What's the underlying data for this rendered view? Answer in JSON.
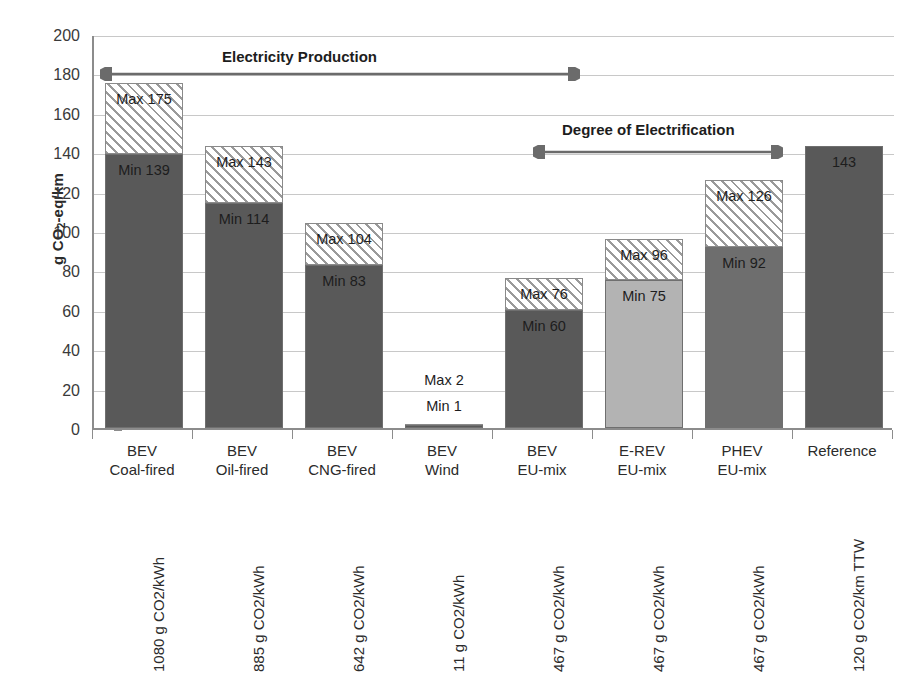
{
  "chart_data": {
    "type": "bar",
    "title": "",
    "xlabel": "",
    "ylabel": "g CO2-eq/km",
    "ylabel_parts": {
      "pre": "g CO",
      "sub": "2",
      "post": "-eq/km"
    },
    "ylim": [
      0,
      200
    ],
    "ytick_step": 20,
    "yticks": [
      0,
      20,
      40,
      60,
      80,
      100,
      120,
      140,
      160,
      180,
      200
    ],
    "grid": true,
    "legend": "none",
    "stacked": "min-max range",
    "categories": [
      "BEV Coal-fired",
      "BEV Oil-fired",
      "BEV CNG-fired",
      "BEV Wind",
      "BEV EU-mix",
      "E-REV EU-mix",
      "PHEV EU-mix",
      "Reference"
    ],
    "series": [
      {
        "name": "Min",
        "values": [
          139,
          114,
          83,
          1,
          60,
          75,
          92,
          143
        ]
      },
      {
        "name": "Max",
        "values": [
          175,
          143,
          104,
          2,
          76,
          96,
          126,
          143
        ]
      }
    ],
    "annotations": [
      {
        "text": "Electricity Production",
        "span": [
          "BEV Coal-fired",
          "BEV EU-mix"
        ],
        "y": 180
      },
      {
        "text": "Degree of Electrification",
        "span": [
          "BEV EU-mix",
          "PHEV EU-mix"
        ],
        "y": 143
      }
    ]
  },
  "y_axis": {
    "title_pre": "g CO",
    "title_sub": "2",
    "title_post": "-eq/km",
    "ticks": [
      "200",
      "180",
      "160",
      "140",
      "120",
      "100",
      "80",
      "60",
      "40",
      "20",
      "0"
    ]
  },
  "annotations": {
    "electricity_production": "Electricity Production",
    "degree_of_electrification": "Degree of Electrification"
  },
  "bars": [
    {
      "key": "bev-coal-fired",
      "cat_line1": "BEV",
      "cat_line2": "Coal-fired",
      "sub_label": "1080 g CO2/kWh",
      "min": 139,
      "max": 175,
      "min_label": "Min 139",
      "max_label": "Max 175",
      "fill": "dark",
      "label_placement": "inside"
    },
    {
      "key": "bev-oil-fired",
      "cat_line1": "BEV",
      "cat_line2": "Oil-fired",
      "sub_label": "885 g CO2/kWh",
      "min": 114,
      "max": 143,
      "min_label": "Min 114",
      "max_label": "Max 143",
      "fill": "dark",
      "label_placement": "inside"
    },
    {
      "key": "bev-cng-fired",
      "cat_line1": "BEV",
      "cat_line2": "CNG-fired",
      "sub_label": "642 g CO2/kWh",
      "min": 83,
      "max": 104,
      "min_label": "Min 83",
      "max_label": "Max 104",
      "fill": "dark",
      "label_placement": "inside"
    },
    {
      "key": "bev-wind",
      "cat_line1": "BEV",
      "cat_line2": "Wind",
      "sub_label": "11 g CO2/kWh",
      "min": 1,
      "max": 2,
      "min_label": "Min 1",
      "max_label": "Max 2",
      "fill": "dark",
      "label_placement": "outside"
    },
    {
      "key": "bev-eu-mix",
      "cat_line1": "BEV",
      "cat_line2": "EU-mix",
      "sub_label": "467 g CO2/kWh",
      "min": 60,
      "max": 76,
      "min_label": "Min 60",
      "max_label": "Max 76",
      "fill": "dark",
      "label_placement": "inside"
    },
    {
      "key": "e-rev-eu-mix",
      "cat_line1": "E-REV",
      "cat_line2": "EU-mix",
      "sub_label": "467 g CO2/kWh",
      "min": 75,
      "max": 96,
      "min_label": "Min 75",
      "max_label": "Max 96",
      "fill": "light",
      "label_placement": "inside"
    },
    {
      "key": "phev-eu-mix",
      "cat_line1": "PHEV",
      "cat_line2": "EU-mix",
      "sub_label": "467 g CO2/kWh",
      "min": 92,
      "max": 126,
      "min_label": "Min 92",
      "max_label": "Max 126",
      "fill": "medium",
      "label_placement": "inside"
    },
    {
      "key": "reference",
      "cat_line1": "Reference",
      "cat_line2": "",
      "sub_label": "120 g CO2/km TTW",
      "min": 143,
      "max": 143,
      "min_label": "143",
      "max_label": "",
      "fill": "dark",
      "label_placement": "inside-top"
    }
  ],
  "colors": {
    "bar_dark": "#595959",
    "bar_medium": "#6e6e6e",
    "bar_light": "#b3b3b3",
    "hatch_line": "#9a9a9a",
    "hatch_bg": "#ffffff",
    "gridline": "#c8c8c8",
    "axis": "#8c8c8c",
    "text": "#2b2b2b",
    "annotation_arrow": "#6b6b6b"
  }
}
